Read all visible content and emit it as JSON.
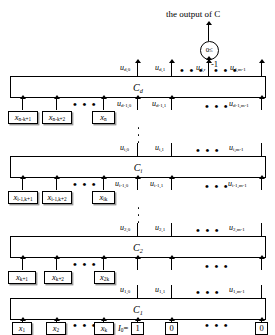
{
  "figure": {
    "output_caption": "the output of C",
    "threshold_symbol": "0≤",
    "bias_label": "-1"
  },
  "layers": [
    {
      "id": "Cd",
      "name": "C",
      "name_sub": "d",
      "outputs": [
        {
          "base": "u",
          "sub": "d,0"
        },
        {
          "base": "u",
          "sub": "d,1"
        },
        {
          "base": "u",
          "sub": "d,r"
        },
        {
          "base": "u",
          "sub": "d,m-1"
        }
      ],
      "inputs_u": [
        {
          "base": "u",
          "sub": "d-1,0"
        },
        {
          "base": "u",
          "sub": "d-1,1"
        },
        {
          "base": "u",
          "sub": "d-1,m-1"
        }
      ],
      "inputs_x": [
        {
          "base": "x",
          "sub": "n-k+1"
        },
        {
          "base": "x",
          "sub": "n-k+2"
        },
        {
          "base": "x",
          "sub": "n"
        }
      ]
    },
    {
      "id": "Ci",
      "name": "C",
      "name_sub": "i",
      "outputs": [
        {
          "base": "u",
          "sub": "i,0"
        },
        {
          "base": "u",
          "sub": "i,1"
        },
        {
          "base": "u",
          "sub": "i,m-1"
        }
      ],
      "inputs_u": [
        {
          "base": "u",
          "sub": "i-1,0"
        },
        {
          "base": "u",
          "sub": "i-1,1"
        },
        {
          "base": "u",
          "sub": "i-1,m-1"
        }
      ],
      "inputs_x": [
        {
          "base": "x",
          "sub": "i-1,k+1"
        },
        {
          "base": "x",
          "sub": "i-1,k+2"
        },
        {
          "base": "x",
          "sub": "ik"
        }
      ]
    },
    {
      "id": "C2",
      "name": "C",
      "name_sub": "2",
      "outputs": [
        {
          "base": "u",
          "sub": "2,0"
        },
        {
          "base": "u",
          "sub": "2,1"
        },
        {
          "base": "u",
          "sub": "2,m-1"
        }
      ],
      "inputs_u": [
        {
          "base": "u",
          "sub": "1,0"
        },
        {
          "base": "u",
          "sub": "1,1"
        },
        {
          "base": "u",
          "sub": "1,m-1"
        }
      ],
      "inputs_x": [
        {
          "base": "x",
          "sub": "k+1"
        },
        {
          "base": "x",
          "sub": "k+2"
        },
        {
          "base": "x",
          "sub": "2k"
        }
      ]
    },
    {
      "id": "C1",
      "name": "C",
      "name_sub": "1",
      "outputs": [
        {
          "base": "u",
          "sub": "1,0"
        },
        {
          "base": "u",
          "sub": "1,1"
        },
        {
          "base": "u",
          "sub": "1,m-1"
        }
      ],
      "inputs_u": [],
      "inputs_x": [
        {
          "base": "x",
          "sub": "1"
        },
        {
          "base": "x",
          "sub": "2"
        },
        {
          "base": "x",
          "sub": "k"
        }
      ]
    }
  ],
  "init_vector": {
    "label_base": "I",
    "label_sub": "0",
    "equals": "=",
    "bits": [
      "1",
      "0",
      "0"
    ]
  },
  "ellipsis": {
    "horizontal": "• • •"
  }
}
